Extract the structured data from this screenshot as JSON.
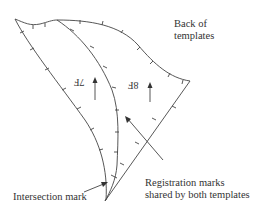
{
  "diagram": {
    "title_label": {
      "line1": "Back of",
      "line2": "templates"
    },
    "templates": [
      {
        "id": "7F",
        "label": "7F",
        "mirrored": true,
        "grain_arrow": "up"
      },
      {
        "id": "8F",
        "label": "8F",
        "mirrored": true,
        "grain_arrow": "up"
      }
    ],
    "callouts": {
      "intersection": "Intersection mark",
      "registration_line1": "Registration marks",
      "registration_line2": "shared by both templates"
    },
    "colors": {
      "line": "#444444",
      "text": "#333333",
      "background": "#ffffff"
    }
  }
}
